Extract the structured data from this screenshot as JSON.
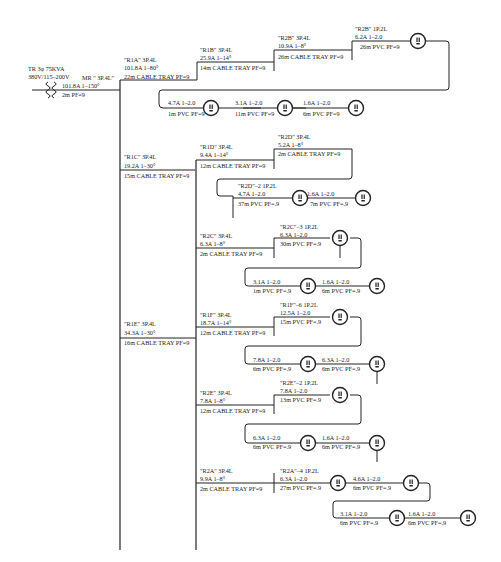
{
  "transformer": {
    "line1": "TR 3φ  75KVA",
    "line2": "380V/115–200V",
    "icon": "transformer-coil-icon"
  },
  "main_breaker": {
    "label": "MR \" 3P.4L\"",
    "rating": "101.8A     1–150°",
    "cable": "2m   PF=9"
  },
  "panels": {
    "R1A": {
      "name": "\"R1A\"   3P.4L",
      "rating": "101.8A   1–80°",
      "cable": "22m  CABLE TRAY PF=9"
    },
    "R1B": {
      "name": "\"R1B\"   3P.4L",
      "rating": "25.9A   1–14°",
      "cable": "14m  CABLE TRAY PF=9"
    },
    "R2B": {
      "name": "\"R2B\"   3P.4L",
      "rating": "10.9A   1–8°",
      "cable": "26m  CABLE TRAY PF=9"
    },
    "R1C": {
      "name": "\"R1C\"   3P.4L",
      "rating": "19.2A   1–30°",
      "cable": "15m  CABLE TRAY PF=9"
    },
    "R1D": {
      "name": "\"R1D\"   3P.4L",
      "rating": "9.4A   1–14°",
      "cable": "12m  CABLE TRAY PF=9"
    },
    "R2D": {
      "name": "\"R2D\"   3P.4L",
      "rating": "5.2A   1–8°",
      "cable": "2m  CABLE TRAY PF=9"
    },
    "R2C": {
      "name": "\"R2C\"   3P.4L",
      "rating": "6.3A   1–8°",
      "cable": "2m  CABLE TRAY PF=9"
    },
    "R1E": {
      "name": "\"R1E\"   3P.4L",
      "rating": "34.3A   1–30°",
      "cable": "16m  CABLE TRAY PF=9"
    },
    "R1F": {
      "name": "\"R1F\"   3P.4L",
      "rating": "18.7A   1–14°",
      "cable": "12m  CABLE TRAY PF=9"
    },
    "R2E": {
      "name": "\"R2E\"   3P.4L",
      "rating": "7.8A   1–8°",
      "cable": "12m  CABLE TRAY PF=9"
    },
    "R2A": {
      "name": "\"R2A\"   3P.4L",
      "rating": "9.9A   1–8°",
      "cable": "2m  CABLE TRAY PF=9"
    }
  },
  "circuits": {
    "R2B_1": {
      "name": "\"R2B\"   1P.2L",
      "rating": "6.2A   1–2.0",
      "cable": "26m  PVC  PF=9"
    },
    "R1B_o1": {
      "rating": "4.7A   1–2.0",
      "cable": "1m  PVC  PF=9"
    },
    "R1B_o2": {
      "rating": "3.1A   1–2.0",
      "cable": "11m  PVC  PF=9"
    },
    "R1B_o3": {
      "rating": "1.6A   1–2.0",
      "cable": "6m  PVC  PF=9"
    },
    "R2D_2": {
      "name": "\"R2D\"–2   1P.2L",
      "rating": "4.7A   1–2.0",
      "cable": "37m  PVC  PF=.9"
    },
    "R2D_o2": {
      "rating": "1.6A   1–2.0",
      "cable": "7m  PVC  PF=.9"
    },
    "R2C_3": {
      "name": "\"R2C\"–3   1P.2L",
      "rating": "6.3A   1–2.0",
      "cable": "30m  PVC PF=.9"
    },
    "R2C_o2": {
      "rating": "3.1A   1–2.0",
      "cable": "1m  PVC  PF=.9"
    },
    "R2C_o3": {
      "rating": "1.6A   1–2.0",
      "cable": "6m  PVC  PF=.9"
    },
    "R1F_6": {
      "name": "\"R1F\"–6   1P.2L",
      "rating": "12.5A   1–2.0",
      "cable": "15m  PVC PF=.9"
    },
    "R1F_o2": {
      "rating": "7.8A   1–2.0",
      "cable": "6m  PVC  PF=.9"
    },
    "R1F_o3": {
      "rating": "6.3A   1–2.0",
      "cable": "6m  PVC  PF=.9"
    },
    "R2E_2": {
      "name": "\"R2E\"–2   1P.2L",
      "rating": "7.8A   1–2.0",
      "cable": "13m  PVC PF=.9"
    },
    "R2E_o2": {
      "rating": "6.3A   1–2.0",
      "cable": "6m  PVC  PF=.9"
    },
    "R2E_o3": {
      "rating": "1.6A   1–2.0",
      "cable": "6m  PVC  PF=.9"
    },
    "R2A_4": {
      "name": "\"R2A\"–4   1P.2L",
      "rating": "6.3A   1–2.0",
      "cable": "27m  PVC PF=.9"
    },
    "R2A_o2": {
      "rating": "4.6A   1–2.0",
      "cable": "6m  PVC PF=.9"
    },
    "R2A_o3": {
      "rating": "3.1A   1–2.0",
      "cable": "6m  PVC  PF=.9"
    },
    "R2A_o4": {
      "rating": "1.6A   1–2.0",
      "cable": "6m  PVC  PF=.9"
    }
  },
  "icons": {
    "outlet": "duplex-outlet-icon"
  }
}
